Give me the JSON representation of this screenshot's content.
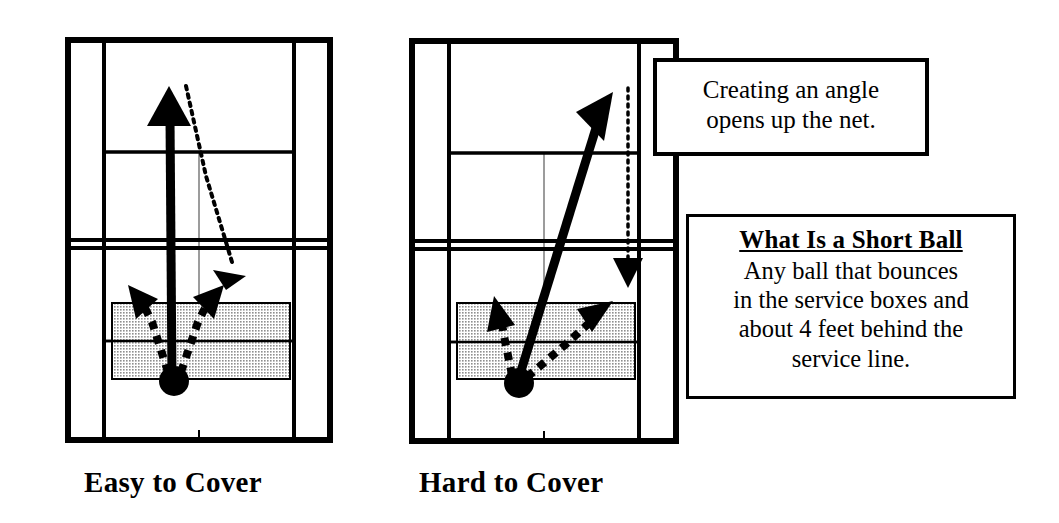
{
  "diagram": {
    "title_semantic": "tennis-short-ball-coverage-diagram",
    "background_color": "#ffffff",
    "line_color": "#000000",
    "shade_color": "#c8c8c8"
  },
  "captions": {
    "left": "Easy to Cover",
    "right": "Hard to Cover"
  },
  "callouts": {
    "angle": {
      "line1": "Creating an angle",
      "line2": "opens up the net."
    },
    "short_ball": {
      "heading": "What Is a Short Ball",
      "line1": "Any ball that bounces",
      "line2": "in the service boxes and",
      "line3": "about 4 feet behind the",
      "line4": "service line."
    }
  },
  "courts": [
    {
      "name": "easy-to-cover-court",
      "caption": "Easy to Cover",
      "shot": {
        "type": "straight-ahead-shot",
        "description": "solid arrow hit straight down the middle from the player position toward the far baseline",
        "from": [
          173,
          380
        ],
        "to": [
          169,
          88
        ]
      },
      "opponent_recovery": {
        "type": "dotted-recovery-path",
        "description": "dotted line showing opponent covering the shot with a short recovery run",
        "from": [
          186,
          86
        ],
        "to": [
          236,
          272
        ]
      },
      "coverage_arrows": [
        {
          "name": "left-coverage-arrow",
          "from": [
            167,
            372
          ],
          "to": [
            132,
            288
          ]
        },
        {
          "name": "right-coverage-arrow",
          "from": [
            182,
            372
          ],
          "to": [
            218,
            288
          ]
        }
      ],
      "short_ball_zone": {
        "x": 112,
        "y": 303,
        "width": 178,
        "height": 76
      }
    },
    {
      "name": "hard-to-cover-court",
      "caption": "Hard to Cover",
      "shot": {
        "type": "angled-shot",
        "description": "solid arrow hit on a sharp cross-court angle from the player position toward the far corner",
        "from": [
          517,
          382
        ],
        "to": [
          613,
          92
        ]
      },
      "opponent_recovery": {
        "type": "dotted-recovery-path",
        "description": "dotted vertical line showing the long distance the opponent must run to cover the angle",
        "from": [
          628,
          88
        ],
        "to": [
          628,
          268
        ]
      },
      "coverage_arrows": [
        {
          "name": "left-coverage-arrow",
          "from": [
            511,
            373
          ],
          "to": [
            497,
            298
          ]
        },
        {
          "name": "right-coverage-arrow",
          "from": [
            527,
            375
          ],
          "to": [
            610,
            300
          ]
        }
      ],
      "short_ball_zone": {
        "x": 457,
        "y": 303,
        "width": 178,
        "height": 76
      }
    }
  ],
  "court_features": {
    "labels": [
      "doubles-sideline",
      "singles-sideline",
      "baseline",
      "service-line",
      "center-service-line",
      "net",
      "center-mark"
    ]
  }
}
